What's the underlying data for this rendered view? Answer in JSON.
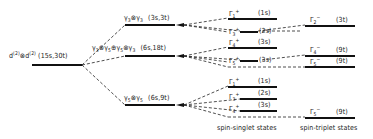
{
  "diagram": {
    "type": "energy-level-splitting",
    "colors": {
      "line": "#111111",
      "text": "#1a1a1a",
      "background": "#ffffff"
    },
    "root": {
      "label": "d(2) ⊗ d(2)",
      "base": "d",
      "sup": "(2)",
      "op": "⊗",
      "count": "(15s,30t)"
    },
    "intermediate": [
      {
        "id": "g3g3",
        "label": "γ3⊗γ3",
        "count": "(3s,3t)"
      },
      {
        "id": "g3g5",
        "label": "γ3⊗γ5⊕γ5⊗γ3",
        "count": "(6s,18t)"
      },
      {
        "id": "g5g5",
        "label": "γ5⊗γ5",
        "count": "(6s,9t)"
      }
    ],
    "singlet_states": [
      {
        "parent": "g3g3",
        "label": "Γ1+",
        "sym": "Γ",
        "sub": "1",
        "sup": "+",
        "count": "(1s)"
      },
      {
        "parent": "g3g3",
        "label": "Γ3+",
        "sym": "Γ",
        "sub": "3",
        "sup": "+",
        "count": "(2s)"
      },
      {
        "parent": "g3g5",
        "label": "Γ4+",
        "sym": "Γ",
        "sub": "4",
        "sup": "+",
        "count": "(3s)"
      },
      {
        "parent": "g3g5",
        "label": "Γ5+",
        "sym": "Γ",
        "sub": "5",
        "sup": "+",
        "count": "(3s)"
      },
      {
        "parent": "g5g5",
        "label": "Γ1+",
        "sym": "Γ",
        "sub": "1",
        "sup": "+",
        "count": "(1s)"
      },
      {
        "parent": "g5g5",
        "label": "Γ3+",
        "sym": "Γ",
        "sub": "3",
        "sup": "+",
        "count": "(2s)"
      },
      {
        "parent": "g5g5",
        "label": "Γ4+",
        "sym": "Γ",
        "sub": "4",
        "sup": "+",
        "count": "(3s)"
      }
    ],
    "triplet_states": [
      {
        "parent": "g3g3",
        "label": "Γ2-",
        "sym": "Γ",
        "sub": "2",
        "sup": "−",
        "count": "(3t)"
      },
      {
        "parent": "g3g5",
        "label": "Γ4-",
        "sym": "Γ",
        "sub": "4",
        "sup": "−",
        "count": "(9t)"
      },
      {
        "parent": "g3g5",
        "label": "Γ5-",
        "sym": "Γ",
        "sub": "5",
        "sup": "−",
        "count": "(9t)"
      },
      {
        "parent": "g5g5",
        "label": "Γ5-",
        "sym": "Γ",
        "sub": "5",
        "sup": "−",
        "count": "(9t)"
      }
    ],
    "column_labels": {
      "singlet": "spin-singlet states",
      "triplet": "spin-triplet states"
    },
    "intermediate_parts": {
      "g3g3": {
        "a": "γ",
        "a_sub": "3",
        "op": "⊗",
        "b": "γ",
        "b_sub": "3"
      },
      "g3g5": {
        "a": "γ",
        "a_sub": "3",
        "op1": "⊗",
        "b": "γ",
        "b_sub": "5",
        "op2": "⊕",
        "c": "γ",
        "c_sub": "5",
        "op3": "⊗",
        "d": "γ",
        "d_sub": "3"
      },
      "g5g5": {
        "a": "γ",
        "a_sub": "5",
        "op": "⊗",
        "b": "γ",
        "b_sub": "5"
      }
    }
  }
}
